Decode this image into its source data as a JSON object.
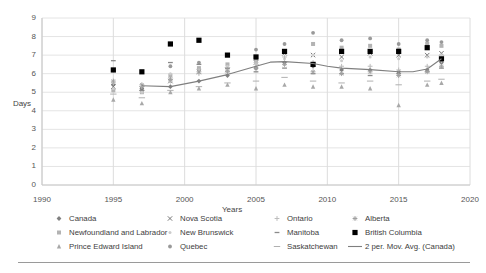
{
  "chart_data": {
    "type": "scatter",
    "title": "",
    "xlabel": "Years",
    "ylabel": "Days",
    "xlim": [
      1990,
      2020
    ],
    "ylim": [
      0,
      9
    ],
    "xticks": [
      1990,
      1995,
      2000,
      2005,
      2010,
      2015,
      2020
    ],
    "yticks": [
      0,
      1,
      2,
      3,
      4,
      5,
      6,
      7,
      8,
      9
    ],
    "grid": true,
    "legend_position": "below",
    "series": [
      {
        "name": "Canada",
        "marker": "diamond",
        "color": "#808080",
        "points": [
          {
            "x": 1995,
            "y": 5.4
          },
          {
            "x": 1997,
            "y": 5.2
          },
          {
            "x": 1999,
            "y": 5.3
          },
          {
            "x": 2001,
            "y": 5.6
          },
          {
            "x": 2003,
            "y": 5.9
          },
          {
            "x": 2005,
            "y": 6.3
          },
          {
            "x": 2007,
            "y": 6.6
          },
          {
            "x": 2009,
            "y": 6.4
          },
          {
            "x": 2011,
            "y": 6.2
          },
          {
            "x": 2013,
            "y": 6.2
          },
          {
            "x": 2015,
            "y": 6.1
          },
          {
            "x": 2017,
            "y": 6.2
          },
          {
            "x": 2018,
            "y": 6.6
          }
        ]
      },
      {
        "name": "Newfoundland and Labrador",
        "marker": "square-light",
        "color": "#b3b3b3",
        "points": [
          {
            "x": 1995,
            "y": 5.1
          },
          {
            "x": 1997,
            "y": 5.0
          },
          {
            "x": 1999,
            "y": 5.9
          },
          {
            "x": 2001,
            "y": 6.3
          },
          {
            "x": 2003,
            "y": 6.5
          },
          {
            "x": 2005,
            "y": 6.8
          },
          {
            "x": 2007,
            "y": 7.2
          },
          {
            "x": 2009,
            "y": 7.6
          },
          {
            "x": 2011,
            "y": 7.4
          },
          {
            "x": 2013,
            "y": 7.5
          },
          {
            "x": 2015,
            "y": 7.3
          },
          {
            "x": 2017,
            "y": 7.6
          },
          {
            "x": 2018,
            "y": 7.5
          }
        ]
      },
      {
        "name": "Prince Edward Island",
        "marker": "triangle",
        "color": "#a8a8a8",
        "points": [
          {
            "x": 1995,
            "y": 4.6
          },
          {
            "x": 1997,
            "y": 4.4
          },
          {
            "x": 1999,
            "y": 5.0
          },
          {
            "x": 2001,
            "y": 5.2
          },
          {
            "x": 2003,
            "y": 5.4
          },
          {
            "x": 2005,
            "y": 5.2
          },
          {
            "x": 2007,
            "y": 5.4
          },
          {
            "x": 2009,
            "y": 5.3
          },
          {
            "x": 2011,
            "y": 5.3
          },
          {
            "x": 2013,
            "y": 5.2
          },
          {
            "x": 2015,
            "y": 4.3
          },
          {
            "x": 2017,
            "y": 5.4
          },
          {
            "x": 2018,
            "y": 5.5
          }
        ]
      },
      {
        "name": "Nova Scotia",
        "marker": "cross",
        "color": "#777777",
        "points": [
          {
            "x": 1995,
            "y": 5.3
          },
          {
            "x": 1997,
            "y": 5.2
          },
          {
            "x": 1999,
            "y": 5.6
          },
          {
            "x": 2001,
            "y": 6.1
          },
          {
            "x": 2003,
            "y": 6.2
          },
          {
            "x": 2005,
            "y": 6.6
          },
          {
            "x": 2007,
            "y": 7.1
          },
          {
            "x": 2009,
            "y": 7.0
          },
          {
            "x": 2011,
            "y": 6.9
          },
          {
            "x": 2013,
            "y": 7.1
          },
          {
            "x": 2015,
            "y": 7.0
          },
          {
            "x": 2017,
            "y": 7.0
          },
          {
            "x": 2018,
            "y": 7.1
          }
        ]
      },
      {
        "name": "New Brunswick",
        "marker": "dot-faint",
        "color": "#cccccc",
        "points": [
          {
            "x": 1995,
            "y": 5.2
          },
          {
            "x": 1997,
            "y": 5.0
          },
          {
            "x": 1999,
            "y": 6.0
          },
          {
            "x": 2001,
            "y": 6.2
          },
          {
            "x": 2003,
            "y": 6.4
          },
          {
            "x": 2005,
            "y": 6.5
          },
          {
            "x": 2007,
            "y": 6.8
          },
          {
            "x": 2009,
            "y": 7.0
          },
          {
            "x": 2011,
            "y": 6.7
          },
          {
            "x": 2013,
            "y": 6.9
          },
          {
            "x": 2015,
            "y": 6.8
          },
          {
            "x": 2017,
            "y": 6.9
          },
          {
            "x": 2018,
            "y": 7.0
          }
        ]
      },
      {
        "name": "Quebec",
        "marker": "circle",
        "color": "#999999",
        "points": [
          {
            "x": 1995,
            "y": 6.2
          },
          {
            "x": 1997,
            "y": 6.1
          },
          {
            "x": 1999,
            "y": 6.4
          },
          {
            "x": 2001,
            "y": 6.6
          },
          {
            "x": 2003,
            "y": 7.0
          },
          {
            "x": 2005,
            "y": 7.3
          },
          {
            "x": 2007,
            "y": 7.6
          },
          {
            "x": 2009,
            "y": 8.2
          },
          {
            "x": 2011,
            "y": 7.8
          },
          {
            "x": 2013,
            "y": 7.9
          },
          {
            "x": 2015,
            "y": 7.6
          },
          {
            "x": 2017,
            "y": 7.8
          },
          {
            "x": 2018,
            "y": 7.7
          }
        ]
      },
      {
        "name": "Ontario",
        "marker": "plus",
        "color": "#bcbcbc",
        "points": [
          {
            "x": 1995,
            "y": 5.5
          },
          {
            "x": 1997,
            "y": 5.3
          },
          {
            "x": 1999,
            "y": 5.6
          },
          {
            "x": 2001,
            "y": 6.0
          },
          {
            "x": 2003,
            "y": 6.2
          },
          {
            "x": 2005,
            "y": 6.6
          },
          {
            "x": 2007,
            "y": 6.9
          },
          {
            "x": 2009,
            "y": 6.6
          },
          {
            "x": 2011,
            "y": 6.4
          },
          {
            "x": 2013,
            "y": 6.4
          },
          {
            "x": 2015,
            "y": 6.2
          },
          {
            "x": 2017,
            "y": 6.4
          },
          {
            "x": 2018,
            "y": 6.7
          }
        ]
      },
      {
        "name": "Manitoba",
        "marker": "dash",
        "color": "#8a8a8a",
        "points": [
          {
            "x": 1995,
            "y": 6.7
          },
          {
            "x": 1997,
            "y": 5.1
          },
          {
            "x": 1999,
            "y": 6.6
          },
          {
            "x": 2001,
            "y": 6.5
          },
          {
            "x": 2003,
            "y": 6.3
          },
          {
            "x": 2005,
            "y": 6.1
          },
          {
            "x": 2007,
            "y": 6.3
          },
          {
            "x": 2009,
            "y": 6.0
          },
          {
            "x": 2011,
            "y": 6.0
          },
          {
            "x": 2013,
            "y": 5.9
          },
          {
            "x": 2015,
            "y": 6.0
          },
          {
            "x": 2017,
            "y": 6.1
          },
          {
            "x": 2018,
            "y": 6.3
          }
        ]
      },
      {
        "name": "Saskatchewan",
        "marker": "dash-long",
        "color": "#b0b0b0",
        "points": [
          {
            "x": 1995,
            "y": 4.9
          },
          {
            "x": 1997,
            "y": 4.7
          },
          {
            "x": 1999,
            "y": 5.1
          },
          {
            "x": 2001,
            "y": 5.3
          },
          {
            "x": 2003,
            "y": 5.5
          },
          {
            "x": 2005,
            "y": 5.6
          },
          {
            "x": 2007,
            "y": 5.8
          },
          {
            "x": 2009,
            "y": 5.6
          },
          {
            "x": 2011,
            "y": 5.5
          },
          {
            "x": 2013,
            "y": 5.6
          },
          {
            "x": 2015,
            "y": 5.4
          },
          {
            "x": 2017,
            "y": 5.6
          },
          {
            "x": 2018,
            "y": 5.7
          }
        ]
      },
      {
        "name": "Alberta",
        "marker": "star",
        "color": "#a0a0a0",
        "points": [
          {
            "x": 1995,
            "y": 5.6
          },
          {
            "x": 1997,
            "y": 5.4
          },
          {
            "x": 1999,
            "y": 5.7
          },
          {
            "x": 2001,
            "y": 6.1
          },
          {
            "x": 2003,
            "y": 6.1
          },
          {
            "x": 2005,
            "y": 6.3
          },
          {
            "x": 2007,
            "y": 6.5
          },
          {
            "x": 2009,
            "y": 6.1
          },
          {
            "x": 2011,
            "y": 6.0
          },
          {
            "x": 2013,
            "y": 6.1
          },
          {
            "x": 2015,
            "y": 5.9
          },
          {
            "x": 2017,
            "y": 6.1
          },
          {
            "x": 2018,
            "y": 6.4
          }
        ]
      },
      {
        "name": "British Columbia",
        "marker": "square-filled",
        "color": "#000000",
        "points": [
          {
            "x": 1995,
            "y": 6.2
          },
          {
            "x": 1997,
            "y": 6.1
          },
          {
            "x": 1999,
            "y": 7.6
          },
          {
            "x": 2001,
            "y": 7.8
          },
          {
            "x": 2003,
            "y": 7.0
          },
          {
            "x": 2005,
            "y": 6.9
          },
          {
            "x": 2007,
            "y": 7.2
          },
          {
            "x": 2009,
            "y": 6.5
          },
          {
            "x": 2011,
            "y": 7.2
          },
          {
            "x": 2013,
            "y": 7.2
          },
          {
            "x": 2015,
            "y": 7.2
          },
          {
            "x": 2017,
            "y": 7.4
          },
          {
            "x": 2018,
            "y": 6.8
          }
        ]
      }
    ],
    "trendline": {
      "name": "2 per. Mov. Avg. (Canada)",
      "color": "#7f7f7f",
      "points": [
        {
          "x": 1997,
          "y": 5.35
        },
        {
          "x": 1999,
          "y": 5.3
        },
        {
          "x": 2001,
          "y": 5.6
        },
        {
          "x": 2003,
          "y": 5.95
        },
        {
          "x": 2005,
          "y": 6.4
        },
        {
          "x": 2006,
          "y": 6.62
        },
        {
          "x": 2007,
          "y": 6.65
        },
        {
          "x": 2009,
          "y": 6.55
        },
        {
          "x": 2010,
          "y": 6.4
        },
        {
          "x": 2011,
          "y": 6.3
        },
        {
          "x": 2013,
          "y": 6.22
        },
        {
          "x": 2015,
          "y": 6.1
        },
        {
          "x": 2016,
          "y": 6.1
        },
        {
          "x": 2017,
          "y": 6.25
        },
        {
          "x": 2018,
          "y": 6.8
        }
      ]
    }
  },
  "axis": {
    "ylabel": "Days",
    "xlabel": "Years",
    "yticks": [
      "9",
      "8",
      "7",
      "6",
      "5",
      "4",
      "3",
      "2",
      "1",
      "0"
    ],
    "xticks": [
      "1990",
      "1995",
      "2000",
      "2005",
      "2010",
      "2015",
      "2020"
    ]
  },
  "legend": {
    "items": [
      {
        "label": "Canada",
        "marker": "diamond",
        "color": "#808080"
      },
      {
        "label": "Nova Scotia",
        "marker": "cross",
        "color": "#777777"
      },
      {
        "label": "Ontario",
        "marker": "plus",
        "color": "#bcbcbc"
      },
      {
        "label": "Alberta",
        "marker": "star",
        "color": "#a0a0a0"
      },
      {
        "label": "Newfoundland and Labrador",
        "marker": "square-light",
        "color": "#b3b3b3"
      },
      {
        "label": "New Brunswick",
        "marker": "dot-faint",
        "color": "#cccccc"
      },
      {
        "label": "Manitoba",
        "marker": "dash",
        "color": "#8a8a8a"
      },
      {
        "label": "British Columbia",
        "marker": "square-filled",
        "color": "#000000"
      },
      {
        "label": "Prince Edward Island",
        "marker": "triangle",
        "color": "#a8a8a8"
      },
      {
        "label": "Quebec",
        "marker": "circle",
        "color": "#999999"
      },
      {
        "label": "Saskatchewan",
        "marker": "dash-long",
        "color": "#b0b0b0"
      },
      {
        "label": "2 per. Mov. Avg. (Canada)",
        "marker": "line",
        "color": "#7f7f7f"
      }
    ]
  }
}
